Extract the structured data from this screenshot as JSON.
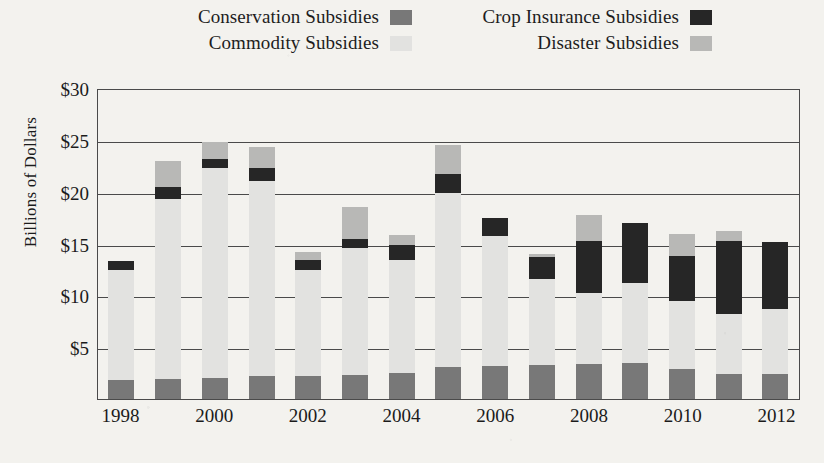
{
  "legend": {
    "rows": [
      [
        {
          "label": "Conservation Subsidies",
          "key": "conservation",
          "color": "#787878",
          "swatch_name": "legend-swatch-conservation"
        },
        {
          "label": "Crop Insurance Subsidies",
          "key": "crop_insurance",
          "color": "#262626",
          "swatch_name": "legend-swatch-crop-insurance"
        }
      ],
      [
        {
          "label": "Commodity Subsidies",
          "key": "commodity",
          "color": "#e2e2e0",
          "swatch_name": "legend-swatch-commodity"
        },
        {
          "label": "Disaster Subsidies",
          "key": "disaster",
          "color": "#b8b8b6",
          "swatch_name": "legend-swatch-disaster"
        }
      ]
    ]
  },
  "axis": {
    "ylabel": "Billions of Dollars",
    "yticks": [
      "$30",
      "$25",
      "$20",
      "$15",
      "$10",
      "$5"
    ],
    "xticks": [
      "1998",
      "",
      "2000",
      "",
      "2002",
      "",
      "2004",
      "",
      "2006",
      "",
      "2008",
      "",
      "2010",
      "",
      "2012"
    ]
  },
  "chart_data": {
    "type": "bar",
    "subtype": "stacked",
    "title": "",
    "xlabel": "",
    "ylabel": "Billions of Dollars",
    "ylim": [
      0,
      30
    ],
    "ytick_values": [
      5,
      10,
      15,
      20,
      25,
      30
    ],
    "grid": "horizontal",
    "legend_position": "top",
    "categories": [
      "1998",
      "1999",
      "2000",
      "2001",
      "2002",
      "2003",
      "2004",
      "2005",
      "2006",
      "2007",
      "2008",
      "2009",
      "2010",
      "2011",
      "2012"
    ],
    "series": [
      {
        "name": "Conservation Subsidies",
        "color": "#787878",
        "values": [
          1.8,
          1.9,
          2.0,
          2.2,
          2.2,
          2.3,
          2.5,
          3.1,
          3.2,
          3.3,
          3.4,
          3.5,
          2.9,
          2.4,
          2.4
        ]
      },
      {
        "name": "Commodity Subsidies",
        "color": "#e2e2e0",
        "values": [
          10.6,
          17.4,
          20.3,
          18.8,
          10.2,
          12.3,
          10.9,
          16.8,
          12.5,
          8.3,
          6.8,
          7.7,
          6.6,
          5.8,
          6.3
        ]
      },
      {
        "name": "Crop Insurance Subsidies",
        "color": "#262626",
        "values": [
          0.9,
          1.2,
          0.9,
          1.3,
          1.0,
          0.8,
          1.5,
          1.8,
          1.8,
          2.1,
          5.0,
          5.8,
          4.3,
          7.0,
          6.4
        ]
      },
      {
        "name": "Disaster Subsidies",
        "color": "#b8b8b6",
        "values": [
          0.0,
          2.5,
          1.6,
          2.0,
          0.8,
          3.1,
          0.9,
          2.8,
          0.0,
          0.3,
          2.6,
          0.0,
          2.1,
          1.0,
          0.0
        ]
      }
    ],
    "totals": [
      13.3,
      23.0,
      24.8,
      24.3,
      14.2,
      18.5,
      15.8,
      24.5,
      17.5,
      14.0,
      17.8,
      17.0,
      15.9,
      16.2,
      15.1
    ]
  }
}
